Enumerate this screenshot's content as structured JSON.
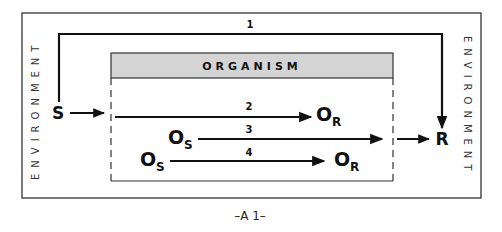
{
  "diagram": {
    "outer_label_left": "ENVIRONMENT",
    "outer_label_right": "ENVIRONMENT",
    "organism_label": "ORGANISM",
    "caption": "–A 1–",
    "stimulus": "S",
    "response": "R",
    "paths": [
      {
        "id": "1",
        "label": "1",
        "from": "S",
        "to": "R",
        "description": "direct path around organism"
      },
      {
        "id": "2",
        "label": "2",
        "from": "S",
        "to": "O_R"
      },
      {
        "id": "3",
        "label": "3",
        "from": "O_S",
        "to": "R"
      },
      {
        "id": "4",
        "label": "4",
        "from": "O_S",
        "to": "O_R"
      }
    ],
    "nodes": {
      "o_main": "O",
      "sub_r": "R",
      "sub_s": "S"
    },
    "colors": {
      "header_fill": "#d4d4d4",
      "line": "#111111",
      "border": "#333333"
    }
  }
}
